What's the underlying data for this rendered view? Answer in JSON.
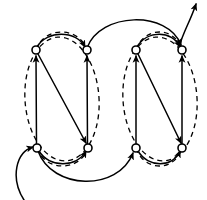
{
  "figure": {
    "title": "",
    "type": "directed-graph-diagram",
    "width": 207,
    "height": 200,
    "background_color": "#ffffff",
    "stroke_color": "#000000"
  },
  "nodes": [
    {
      "id": "n1",
      "label": "",
      "x": 36,
      "y": 50,
      "r": 4,
      "row": "top",
      "column": 1,
      "group": "g1"
    },
    {
      "id": "n2",
      "label": "",
      "x": 87,
      "y": 50,
      "r": 4,
      "row": "top",
      "column": 2,
      "group": "g1"
    },
    {
      "id": "n3",
      "label": "",
      "x": 136,
      "y": 50,
      "r": 4,
      "row": "top",
      "column": 3,
      "group": "g2"
    },
    {
      "id": "n4",
      "label": "",
      "x": 182,
      "y": 50,
      "r": 4,
      "row": "top",
      "column": 4,
      "group": "g2"
    },
    {
      "id": "n5",
      "label": "",
      "x": 37,
      "y": 148,
      "r": 4,
      "row": "bottom",
      "column": 1,
      "group": "g1"
    },
    {
      "id": "n6",
      "label": "",
      "x": 88,
      "y": 148,
      "r": 4,
      "row": "bottom",
      "column": 2,
      "group": "g1"
    },
    {
      "id": "n7",
      "label": "",
      "x": 136,
      "y": 148,
      "r": 4,
      "row": "bottom",
      "column": 3,
      "group": "g2"
    },
    {
      "id": "n8",
      "label": "",
      "x": 182,
      "y": 148,
      "r": 4,
      "row": "bottom",
      "column": 4,
      "group": "g2"
    }
  ],
  "groups": [
    {
      "id": "g1",
      "label": "",
      "style": "dashed-ellipse",
      "cx": 62,
      "cy": 99,
      "rx": 37,
      "ry": 62,
      "members": [
        "n1",
        "n2",
        "n5",
        "n6"
      ]
    },
    {
      "id": "g2",
      "label": "",
      "style": "dashed-ellipse",
      "cx": 160,
      "cy": 99,
      "rx": 37,
      "ry": 62,
      "members": [
        "n3",
        "n4",
        "n7",
        "n8"
      ]
    }
  ],
  "edges": [
    {
      "id": "e1",
      "from": "n5",
      "to": "n1",
      "label": "",
      "style": "solid",
      "kind": "vertical-up"
    },
    {
      "id": "e2",
      "from": "n6",
      "to": "n2",
      "label": "",
      "style": "solid",
      "kind": "vertical-up"
    },
    {
      "id": "e3",
      "from": "n7",
      "to": "n3",
      "label": "",
      "style": "solid",
      "kind": "vertical-up"
    },
    {
      "id": "e4",
      "from": "n8",
      "to": "n4",
      "label": "",
      "style": "solid",
      "kind": "vertical-up"
    },
    {
      "id": "e5",
      "from": "n1",
      "to": "n6",
      "label": "",
      "style": "solid",
      "kind": "diagonal-down"
    },
    {
      "id": "e6",
      "from": "n3",
      "to": "n8",
      "label": "",
      "style": "solid",
      "kind": "diagonal-down"
    },
    {
      "id": "e7",
      "from": "n1",
      "to": "n2",
      "label": "",
      "style": "solid",
      "kind": "arc-top-short"
    },
    {
      "id": "e8",
      "from": "n3",
      "to": "n4",
      "label": "",
      "style": "solid",
      "kind": "arc-top-short"
    },
    {
      "id": "e9",
      "from": "n2",
      "to": "n4",
      "label": "",
      "style": "solid",
      "kind": "arc-top-long"
    },
    {
      "id": "e10",
      "from": "n5",
      "to": "n6",
      "label": "",
      "style": "solid",
      "kind": "arc-bottom-short"
    },
    {
      "id": "e11",
      "from": "n7",
      "to": "n8",
      "label": "",
      "style": "solid",
      "kind": "arc-bottom-short"
    },
    {
      "id": "e12",
      "from": "n5",
      "to": "n7",
      "label": "",
      "style": "solid",
      "kind": "arc-bottom-long"
    },
    {
      "id": "e13",
      "from": "entry",
      "to": "n5",
      "label": "",
      "style": "solid",
      "kind": "entry-curve"
    },
    {
      "id": "e14",
      "from": "n4",
      "to": "exit",
      "label": "",
      "style": "solid",
      "kind": "exit-curve"
    },
    {
      "id": "e15",
      "from": "n2",
      "to": "n1",
      "label": "",
      "style": "dashed",
      "kind": "arc-top-dashed"
    },
    {
      "id": "e16",
      "from": "n4",
      "to": "n3",
      "label": "",
      "style": "dashed",
      "kind": "arc-top-dashed"
    },
    {
      "id": "e17",
      "from": "n6",
      "to": "n5",
      "label": "",
      "style": "dashed",
      "kind": "arc-bottom-dashed"
    },
    {
      "id": "e18",
      "from": "n8",
      "to": "n7",
      "label": "",
      "style": "dashed",
      "kind": "arc-bottom-dashed"
    }
  ],
  "annotations": {
    "entry_marker": "",
    "exit_marker": ""
  }
}
